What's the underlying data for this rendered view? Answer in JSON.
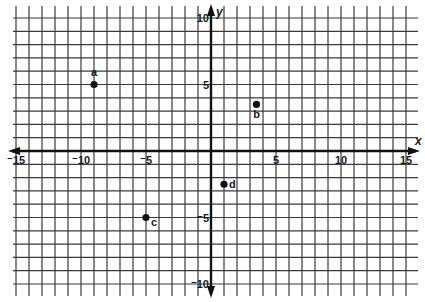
{
  "chart_data": {
    "type": "scatter",
    "title": "",
    "xlabel": "x",
    "ylabel": "y",
    "xlim": [
      -15,
      15
    ],
    "ylim": [
      -10,
      10
    ],
    "grid": true,
    "grid_step": 1,
    "x_ticks": [
      {
        "value": -15,
        "label": "⁻15"
      },
      {
        "value": -10,
        "label": "⁻10"
      },
      {
        "value": -5,
        "label": "⁻5"
      },
      {
        "value": 5,
        "label": "5"
      },
      {
        "value": 10,
        "label": "10"
      },
      {
        "value": 15,
        "label": "15"
      }
    ],
    "y_ticks": [
      {
        "value": 10,
        "label": "10"
      },
      {
        "value": 5,
        "label": "5"
      },
      {
        "value": -5,
        "label": "⁻5"
      },
      {
        "value": -10,
        "label": "⁻10"
      }
    ],
    "points": [
      {
        "label": "a",
        "x": -9,
        "y": 5
      },
      {
        "label": "b",
        "x": 3.5,
        "y": 3.5
      },
      {
        "label": "c",
        "x": -5,
        "y": -5
      },
      {
        "label": "d",
        "x": 1,
        "y": -2.5
      }
    ]
  },
  "colors": {
    "grid": "#3a3a3a",
    "axis": "#111111",
    "point": "#111111",
    "background": "#ffffff"
  }
}
